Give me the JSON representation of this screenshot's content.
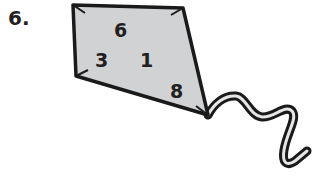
{
  "problem": {
    "number_label": "6."
  },
  "kite": {
    "fill_color": "#d1d2d4",
    "outline_color": "#1a1a1a",
    "numbers": [
      {
        "value": "6",
        "x": 114,
        "y": 37
      },
      {
        "value": "3",
        "x": 95,
        "y": 67
      },
      {
        "value": "1",
        "x": 140,
        "y": 67
      },
      {
        "value": "8",
        "x": 170,
        "y": 98
      }
    ]
  }
}
